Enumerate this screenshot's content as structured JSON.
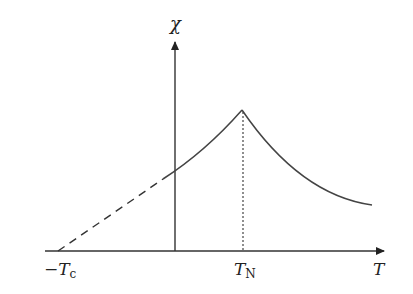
{
  "diagram": {
    "type": "susceptibility-vs-temperature",
    "y_axis_label": "χ",
    "x_axis_label": "T",
    "labels": {
      "neg_tc_prefix": "−T",
      "neg_tc_sub": "c",
      "tn_main": "T",
      "tn_sub": "N"
    },
    "curve": {
      "dashed_extrapolation": "linear from −Tc to the χ axis",
      "peak_at": "TN",
      "right_branch": "decays above TN"
    },
    "colors": {
      "line": "#333333",
      "background": "#ffffff"
    }
  }
}
